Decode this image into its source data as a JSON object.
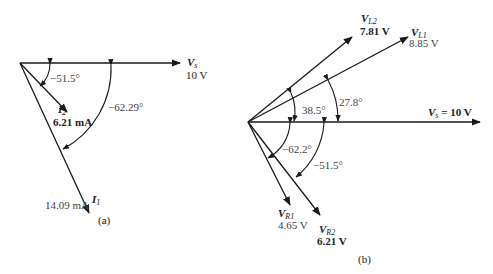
{
  "diagram_a": {
    "caption": "(a)",
    "vs": {
      "symbol": "V",
      "subscript": "s",
      "value": "10 V"
    },
    "i2": {
      "symbol": "I",
      "subscript": "2",
      "value": "6.21 mA"
    },
    "i1": {
      "symbol": "I",
      "subscript": "1",
      "value": "14.09 mA"
    },
    "angle_i2": "−51.5°",
    "angle_i1": "−62.29°"
  },
  "diagram_b": {
    "caption": "(b)",
    "vs": {
      "label": "V",
      "subscript": "s",
      "value": "= 10 V"
    },
    "vl2": {
      "symbol": "V",
      "subscript": "L2",
      "value": "7.81 V"
    },
    "vl1": {
      "symbol": "V",
      "subscript": "L1",
      "value": "8.85 V"
    },
    "vr1": {
      "symbol": "V",
      "subscript": "R1",
      "value": "4.65 V"
    },
    "vr2": {
      "symbol": "V",
      "subscript": "R2",
      "value": "6.21 V"
    },
    "angle_vl2": "38.5°",
    "angle_vl1": "27.8°",
    "angle_vr1": "−62.2°",
    "angle_vr2": "−51.5°"
  }
}
